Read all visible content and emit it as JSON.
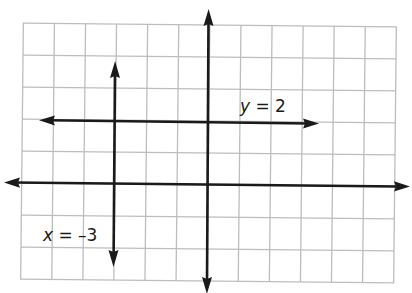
{
  "diagram": {
    "type": "coordinate-plane",
    "grid": {
      "columns": 12,
      "rows": 8,
      "color": "#bdbdbd"
    },
    "axes": {
      "color": "#1a1a1a",
      "x_axis": "horizontal axis with arrows at both ends",
      "y_axis": "vertical axis with arrows at both ends"
    },
    "lines": [
      {
        "name": "horizontal-line",
        "equation": "y = 2",
        "label_var": "y",
        "label_rest": " = 2",
        "orientation": "horizontal",
        "value": 2
      },
      {
        "name": "vertical-line",
        "equation": "x = –3",
        "label_var": "x",
        "label_rest": " = –3",
        "orientation": "vertical",
        "value": -3
      }
    ]
  }
}
